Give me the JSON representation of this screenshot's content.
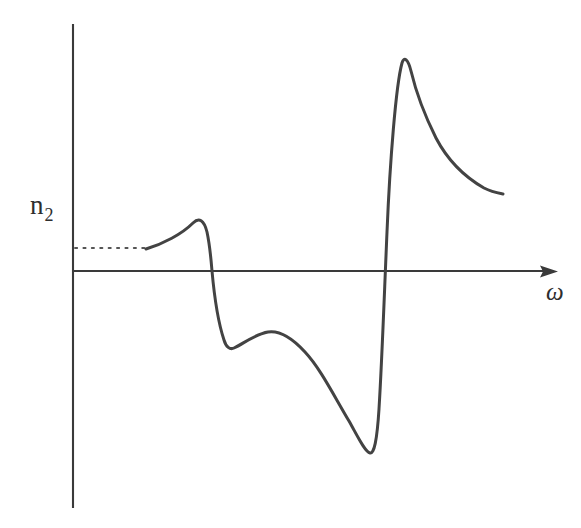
{
  "figure": {
    "name": "nonlinear-refractive-index-dispersion",
    "background_color": "#ffffff",
    "ink_color": "#434343",
    "axis_color": "#3a3a3a",
    "width": 581,
    "height": 528
  },
  "labels": {
    "y_axis_symbol": "n",
    "y_axis_subscript": "2",
    "x_axis_symbol": "ω"
  },
  "chart_data": {
    "type": "line",
    "title": "",
    "xlabel": "ω",
    "ylabel": "n₂",
    "grid": false,
    "legend": false,
    "axes": {
      "x_axis_y_px": 271,
      "y_axis_x_px": 73,
      "y_axis_top_px": 24,
      "y_axis_bottom_px": 508,
      "x_axis_start_px": 73,
      "x_axis_arrow_tip_px": 558,
      "arrow_on_x_axis": true,
      "arrow_on_y_axis": false,
      "tick_labels_x": [],
      "tick_labels_y": []
    },
    "baseline": {
      "name": "low-frequency-asymptote",
      "style": "dotted",
      "y_px": 248,
      "x_start_px": 75,
      "x_end_px": 146
    },
    "annotations": [
      {
        "name": "first-resonance-peak",
        "x_px": 198,
        "y_px": 220
      },
      {
        "name": "first-resonance-zero-crossing",
        "x_px": 212,
        "y_px": 271
      },
      {
        "name": "first-resonance-trough",
        "x_px": 228,
        "y_px": 349
      },
      {
        "name": "intermediate-hump",
        "x_px": 268,
        "y_px": 332
      },
      {
        "name": "second-resonance-trough",
        "x_px": 370,
        "y_px": 453
      },
      {
        "name": "second-resonance-zero-crossing",
        "x_px": 385,
        "y_px": 272
      },
      {
        "name": "second-resonance-peak",
        "x_px": 404,
        "y_px": 58
      },
      {
        "name": "high-frequency-tail-end",
        "x_px": 503,
        "y_px": 194
      }
    ],
    "curve_points_px": [
      [
        146,
        249
      ],
      [
        160,
        244
      ],
      [
        172,
        238
      ],
      [
        182,
        231
      ],
      [
        190,
        225
      ],
      [
        196,
        221
      ],
      [
        200,
        221
      ],
      [
        205,
        228
      ],
      [
        209,
        247
      ],
      [
        212,
        271
      ],
      [
        216,
        299
      ],
      [
        220,
        325
      ],
      [
        224,
        342
      ],
      [
        228,
        349
      ],
      [
        233,
        348
      ],
      [
        240,
        343
      ],
      [
        249,
        337
      ],
      [
        259,
        333
      ],
      [
        268,
        332
      ],
      [
        280,
        334
      ],
      [
        292,
        340
      ],
      [
        305,
        351
      ],
      [
        318,
        368
      ],
      [
        331,
        390
      ],
      [
        345,
        414
      ],
      [
        358,
        437
      ],
      [
        366,
        449
      ],
      [
        370,
        453
      ],
      [
        374,
        447
      ],
      [
        378,
        410
      ],
      [
        382,
        330
      ],
      [
        386,
        240
      ],
      [
        392,
        150
      ],
      [
        398,
        85
      ],
      [
        402,
        62
      ],
      [
        406,
        58
      ],
      [
        410,
        66
      ],
      [
        416,
        86
      ],
      [
        424,
        111
      ],
      [
        434,
        135
      ],
      [
        446,
        156
      ],
      [
        460,
        172
      ],
      [
        476,
        184
      ],
      [
        492,
        191
      ],
      [
        503,
        194
      ]
    ],
    "curve_path_d": "M 146,249 C 163,244 182,234 193,223 C 199,217 204,220 207,232 C 210,246 211,259 212,271 C 214,293 218,322 224,340 C 226,347 230,350 234,348 C 243,344 255,334 268,332 C 281,330 294,340 305,352 C 320,368 333,394 349,421 C 358,437 365,452 370,453 C 374,454 377,441 379,409 C 382,360 384,302 387,232 C 390,160 396,85 402,63 C 404,56 408,59 411,71 C 416,92 424,114 436,138 C 447,159 463,176 484,188 C 492,192 498,193 503,194"
  }
}
